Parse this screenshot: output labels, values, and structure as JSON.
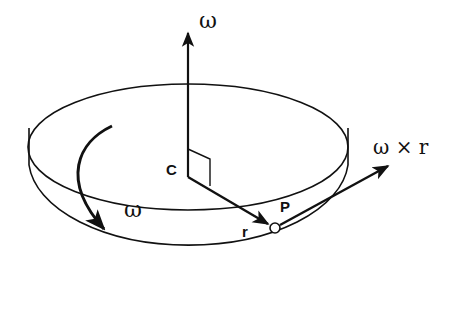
{
  "diagram": {
    "labels": {
      "omega_axis": "ω",
      "omega_rotation": "ω",
      "center": "C",
      "point": "P",
      "radius": "r",
      "velocity": "ω × r"
    },
    "colors": {
      "ink": "#111111",
      "background": "#ffffff"
    }
  }
}
